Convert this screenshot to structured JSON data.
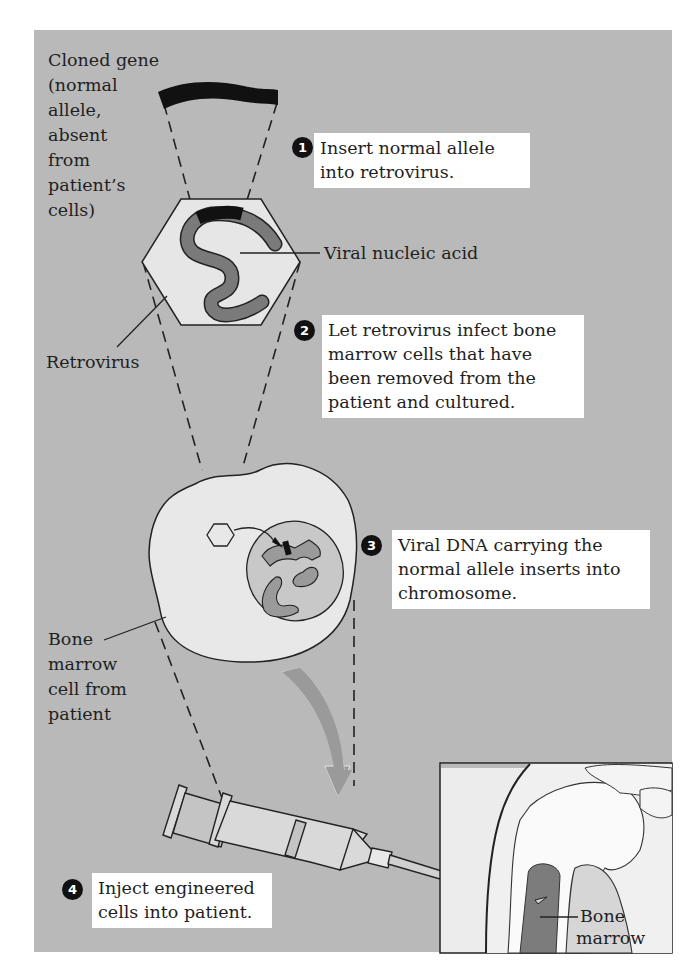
{
  "figure": {
    "background_color": "#b9b9b9",
    "label_box_color": "#ffffff",
    "nucleic_acid_color": "#7a7a7a",
    "gene_color": "#111111"
  },
  "labels": {
    "cloned_gene": [
      "Cloned gene",
      "(normal",
      "allele,",
      "absent",
      "from",
      "patient’s",
      "cells)"
    ],
    "viral_nucleic_acid": "Viral nucleic acid",
    "retrovirus": "Retrovirus",
    "bone_marrow_cell": [
      "Bone",
      "marrow",
      "cell from",
      "patient"
    ],
    "bone_marrow": [
      "Bone",
      "marrow"
    ]
  },
  "steps": [
    {
      "number": "1",
      "lines": [
        "Insert normal allele",
        "into retrovirus."
      ]
    },
    {
      "number": "2",
      "lines": [
        "Let retrovirus infect bone",
        "marrow cells that have",
        "been removed from the",
        "patient and cultured."
      ]
    },
    {
      "number": "3",
      "lines": [
        "Viral DNA carrying the",
        "normal allele inserts into",
        "chromosome."
      ]
    },
    {
      "number": "4",
      "lines": [
        "Inject engineered",
        "cells into patient."
      ]
    }
  ]
}
